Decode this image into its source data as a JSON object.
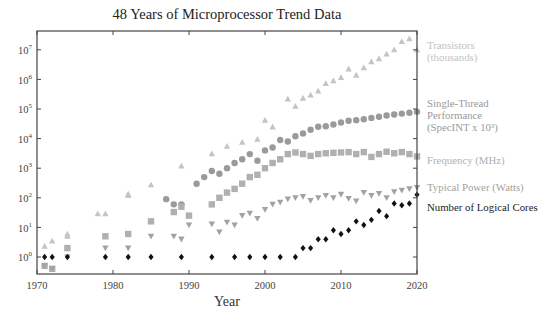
{
  "chart_data": {
    "type": "scatter",
    "title": "48 Years of Microprocessor Trend Data",
    "xlabel": "Year",
    "ylabel": "",
    "xlim": [
      1970,
      2020
    ],
    "ylim_log10": [
      -0.55,
      7.3
    ],
    "yscale": "log",
    "grid": false,
    "legend_position": "right, inline labels",
    "x_ticks": [
      "1970",
      "1980",
      "1990",
      "2000",
      "2010",
      "2020"
    ],
    "y_ticks": [
      "10^0",
      "10^1",
      "10^2",
      "10^3",
      "10^4",
      "10^5",
      "10^6",
      "10^7"
    ],
    "series": [
      {
        "name": "Transistors (thousands)",
        "marker": "triangle-up",
        "color": "#c4c4c4",
        "points": [
          [
            1971,
            2.3
          ],
          [
            1972,
            3.5
          ],
          [
            1974,
            5
          ],
          [
            1974,
            6
          ],
          [
            1978,
            29
          ],
          [
            1979,
            29
          ],
          [
            1982,
            134
          ],
          [
            1982,
            120
          ],
          [
            1985,
            275
          ],
          [
            1989,
            1200
          ],
          [
            1993,
            3100
          ],
          [
            1995,
            5500
          ],
          [
            1997,
            7500
          ],
          [
            1999,
            9500
          ],
          [
            2000,
            42000
          ],
          [
            2001,
            25000
          ],
          [
            2003,
            220000
          ],
          [
            2004,
            125000
          ],
          [
            2005,
            230000
          ],
          [
            2006,
            300000
          ],
          [
            2007,
            410000
          ],
          [
            2008,
            730000
          ],
          [
            2009,
            900000
          ],
          [
            2010,
            1170000
          ],
          [
            2011,
            2270000
          ],
          [
            2012,
            1400000
          ],
          [
            2013,
            2500000
          ],
          [
            2014,
            4000000
          ],
          [
            2015,
            5000000
          ],
          [
            2016,
            7200000
          ],
          [
            2017,
            10000000
          ],
          [
            2018,
            19200000
          ],
          [
            2019,
            23600000
          ],
          [
            2020,
            10000000
          ]
        ]
      },
      {
        "name": "Single-Thread Performance (SpecINT x 10^3)",
        "marker": "circle",
        "color": "#9a9a9a",
        "points": [
          [
            1987,
            90
          ],
          [
            1988,
            60
          ],
          [
            1989,
            60
          ],
          [
            1991,
            300
          ],
          [
            1992,
            500
          ],
          [
            1993,
            800
          ],
          [
            1994,
            650
          ],
          [
            1995,
            1000
          ],
          [
            1996,
            1500
          ],
          [
            1997,
            2000
          ],
          [
            1998,
            3000
          ],
          [
            1999,
            1800
          ],
          [
            2000,
            4000
          ],
          [
            2001,
            5000
          ],
          [
            2002,
            9000
          ],
          [
            2003,
            8000
          ],
          [
            2004,
            12000
          ],
          [
            2005,
            15000
          ],
          [
            2006,
            20000
          ],
          [
            2007,
            25000
          ],
          [
            2008,
            26000
          ],
          [
            2009,
            30000
          ],
          [
            2010,
            35000
          ],
          [
            2011,
            40000
          ],
          [
            2012,
            42000
          ],
          [
            2013,
            45000
          ],
          [
            2014,
            50000
          ],
          [
            2015,
            55000
          ],
          [
            2016,
            60000
          ],
          [
            2017,
            65000
          ],
          [
            2018,
            70000
          ],
          [
            2019,
            75000
          ],
          [
            2020,
            80000
          ]
        ]
      },
      {
        "name": "Frequency (MHz)",
        "marker": "square",
        "color": "#b0b0b0",
        "points": [
          [
            1971,
            0.5
          ],
          [
            1972,
            0.4
          ],
          [
            1974,
            2
          ],
          [
            1979,
            5
          ],
          [
            1982,
            6
          ],
          [
            1985,
            16
          ],
          [
            1988,
            33
          ],
          [
            1989,
            50
          ],
          [
            1990,
            25
          ],
          [
            1993,
            60
          ],
          [
            1994,
            100
          ],
          [
            1995,
            150
          ],
          [
            1996,
            200
          ],
          [
            1997,
            300
          ],
          [
            1998,
            500
          ],
          [
            1999,
            600
          ],
          [
            2000,
            1000
          ],
          [
            2001,
            1500
          ],
          [
            2002,
            2000
          ],
          [
            2003,
            3000
          ],
          [
            2004,
            3400
          ],
          [
            2005,
            3000
          ],
          [
            2006,
            2600
          ],
          [
            2007,
            3000
          ],
          [
            2008,
            3200
          ],
          [
            2009,
            3300
          ],
          [
            2010,
            3400
          ],
          [
            2011,
            3500
          ],
          [
            2012,
            3000
          ],
          [
            2013,
            3500
          ],
          [
            2014,
            2400
          ],
          [
            2015,
            3000
          ],
          [
            2016,
            3600
          ],
          [
            2017,
            3200
          ],
          [
            2018,
            3500
          ],
          [
            2019,
            3000
          ],
          [
            2020,
            2500
          ]
        ]
      },
      {
        "name": "Typical Power (Watts)",
        "marker": "triangle-down",
        "color": "#a2a2a2",
        "points": [
          [
            1971,
            0.5
          ],
          [
            1972,
            0.4
          ],
          [
            1974,
            1
          ],
          [
            1979,
            2
          ],
          [
            1982,
            2
          ],
          [
            1985,
            5
          ],
          [
            1988,
            5
          ],
          [
            1989,
            4
          ],
          [
            1990,
            12
          ],
          [
            1993,
            13
          ],
          [
            1994,
            7
          ],
          [
            1995,
            15
          ],
          [
            1996,
            12
          ],
          [
            1997,
            25
          ],
          [
            1998,
            30
          ],
          [
            1999,
            20
          ],
          [
            2000,
            40
          ],
          [
            2001,
            60
          ],
          [
            2002,
            70
          ],
          [
            2003,
            90
          ],
          [
            2004,
            100
          ],
          [
            2005,
            110
          ],
          [
            2006,
            80
          ],
          [
            2007,
            100
          ],
          [
            2008,
            120
          ],
          [
            2009,
            100
          ],
          [
            2010,
            130
          ],
          [
            2011,
            95
          ],
          [
            2012,
            77
          ],
          [
            2013,
            150
          ],
          [
            2014,
            120
          ],
          [
            2015,
            140
          ],
          [
            2016,
            100
          ],
          [
            2017,
            160
          ],
          [
            2018,
            180
          ],
          [
            2019,
            200
          ],
          [
            2020,
            220
          ]
        ]
      },
      {
        "name": "Number of Logical Cores",
        "marker": "diamond",
        "color": "#111111",
        "points": [
          [
            1971,
            1
          ],
          [
            1972,
            1
          ],
          [
            1974,
            1
          ],
          [
            1979,
            1
          ],
          [
            1982,
            1
          ],
          [
            1985,
            1
          ],
          [
            1989,
            1
          ],
          [
            1993,
            1
          ],
          [
            1996,
            1
          ],
          [
            1998,
            1
          ],
          [
            2000,
            1
          ],
          [
            2002,
            1
          ],
          [
            2004,
            1
          ],
          [
            2005,
            2
          ],
          [
            2006,
            2
          ],
          [
            2007,
            4
          ],
          [
            2008,
            4
          ],
          [
            2009,
            8
          ],
          [
            2010,
            6
          ],
          [
            2011,
            8
          ],
          [
            2012,
            16
          ],
          [
            2013,
            12
          ],
          [
            2014,
            18
          ],
          [
            2015,
            36
          ],
          [
            2016,
            24
          ],
          [
            2017,
            64
          ],
          [
            2018,
            56
          ],
          [
            2019,
            64
          ],
          [
            2020,
            128
          ]
        ]
      }
    ]
  },
  "title": "48 Years of Microprocessor Trend Data",
  "x_axis": {
    "label": "Year",
    "ticks": [
      "1970",
      "1980",
      "1990",
      "2000",
      "2010",
      "2020"
    ]
  },
  "y_axis": {
    "ticks": [
      {
        "base": "10",
        "exp": "0"
      },
      {
        "base": "10",
        "exp": "1"
      },
      {
        "base": "10",
        "exp": "2"
      },
      {
        "base": "10",
        "exp": "3"
      },
      {
        "base": "10",
        "exp": "4"
      },
      {
        "base": "10",
        "exp": "5"
      },
      {
        "base": "10",
        "exp": "6"
      },
      {
        "base": "10",
        "exp": "7"
      }
    ]
  },
  "legend": [
    {
      "line1": "Transistors",
      "line2": "(thousands)",
      "color": "#c2c2c2"
    },
    {
      "line1": "Single-Thread",
      "line2": "Performance",
      "line3": "(SpecINT x 10³)",
      "color": "#9a9a9a"
    },
    {
      "line1": "Frequency (MHz)",
      "color": "#b0b0b0"
    },
    {
      "line1": "Typical Power (Watts)",
      "color": "#a2a2a2"
    },
    {
      "line1": "Number of Logical Cores",
      "color": "#222222"
    }
  ]
}
